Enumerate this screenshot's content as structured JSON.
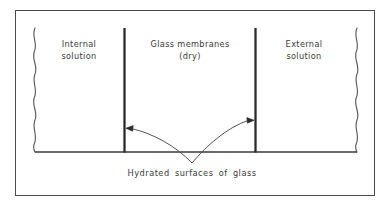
{
  "figure": {
    "type": "schematic-diagram",
    "background_color": "#ffffff",
    "line_color": "#2b2b2b",
    "text_color": "#3a3a3a",
    "frame": {
      "name": "outer-border",
      "x": 15,
      "y": 10,
      "width": 360,
      "height": 186,
      "stroke_width": 1
    },
    "regions": [
      {
        "id": "internal",
        "label_line1": "Internal",
        "label_line2": "solution",
        "center_x": 79
      },
      {
        "id": "membrane",
        "label_line1": "Glass membranes",
        "label_line2": "(dry)",
        "center_x": 190
      },
      {
        "id": "external",
        "label_line1": "External",
        "label_line2": "solution",
        "center_x": 304
      }
    ],
    "membrane_walls": [
      {
        "id": "left-wall",
        "x": 124,
        "y_top": 28,
        "y_bottom": 152,
        "stroke_width": 2.2
      },
      {
        "id": "right-wall",
        "x": 255,
        "y_top": 28,
        "y_bottom": 152,
        "stroke_width": 2.2
      }
    ],
    "baseline": {
      "x1": 35,
      "x2": 357,
      "y": 152,
      "stroke_width": 1.2
    },
    "wavy_edges": [
      {
        "id": "left-wavy-edge",
        "x": 35,
        "y_top": 28,
        "y_bottom": 152
      },
      {
        "id": "right-wavy-edge",
        "x": 357,
        "y_top": 28,
        "y_bottom": 152
      }
    ],
    "annotation": {
      "caption": "Hydrated surfaces of glass",
      "caption_x": 192,
      "caption_y": 174,
      "leader_origin": {
        "x": 192,
        "y": 163
      },
      "arrows": [
        {
          "id": "arrow-to-left-wall",
          "tip_x": 126,
          "tip_y": 128,
          "direction": "left"
        },
        {
          "id": "arrow-to-right-wall",
          "tip_x": 253,
          "tip_y": 120,
          "direction": "right"
        }
      ]
    }
  }
}
